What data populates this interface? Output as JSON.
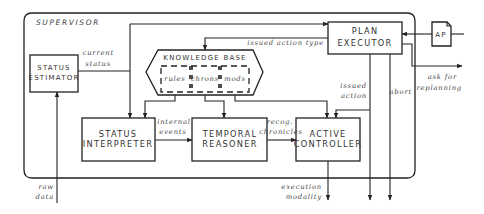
{
  "diagram": {
    "container": {
      "label": "SUPERVISOR"
    },
    "nodes": {
      "status_estimator": {
        "line1": "STATUS",
        "line2": "ESTIMATOR"
      },
      "plan_executor": {
        "line1": "PLAN",
        "line2": "EXECUTOR"
      },
      "ap_document": {
        "label": "AP"
      },
      "knowledge_base": {
        "label": "KNOWLEDGE BASE",
        "sections": [
          "rules",
          "chrons",
          "mods"
        ]
      },
      "status_interpreter": {
        "line1": "STATUS",
        "line2": "INTERPRETER"
      },
      "temporal_reasoner": {
        "line1": "TEMPORAL",
        "line2": "REASONER"
      },
      "active_controller": {
        "line1": "ACTIVE",
        "line2": "CONTROLLER"
      }
    },
    "edge_labels": {
      "current_status": {
        "line1": "current",
        "line2": "status"
      },
      "issued_action_type": "issued action type",
      "issued_action": {
        "line1": "issued",
        "line2": "action"
      },
      "abort": "abort",
      "ask_for_replanning": {
        "line1": "ask for",
        "line2": "replanning"
      },
      "internal_events": {
        "line1": "internal",
        "line2": "events"
      },
      "recog_chronicles": {
        "line1": "recog.",
        "line2": "chronicles"
      },
      "raw_data": {
        "line1": "raw",
        "line2": "data"
      },
      "execution_modality": {
        "line1": "execution",
        "line2": "modality"
      }
    }
  }
}
